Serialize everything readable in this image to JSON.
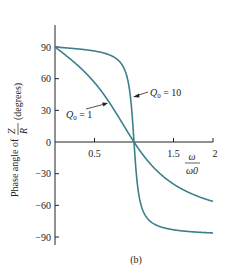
{
  "chart_data": {
    "type": "line",
    "title": "",
    "caption": "(b)",
    "xlabel": "ω/ω0",
    "xlabel_num": "ω",
    "xlabel_den": "ω0",
    "ylabel": "Phase angle of Zp/Rp (degrees)",
    "ylabel_prefix": "Phase angle of",
    "ylabel_num": "Z",
    "ylabel_num_sub": "p",
    "ylabel_den": "R",
    "ylabel_den_sub": "p",
    "ylabel_suffix": "(degrees)",
    "xlim": [
      0,
      2
    ],
    "ylim": [
      -90,
      90
    ],
    "x_ticks": [
      0.5,
      1.5,
      2
    ],
    "x_tick_labels": [
      "0.5",
      "1.5",
      "2"
    ],
    "y_ticks": [
      90,
      60,
      30,
      0,
      -30,
      -60,
      -90
    ],
    "y_tick_labels": [
      "90",
      "60",
      "30",
      "0",
      "−30",
      "−60",
      "−90"
    ],
    "grid": false,
    "series": [
      {
        "name": "Q0 = 1",
        "label": "Q",
        "label_sub": "0",
        "label_value": " = 1",
        "x": [
          0.01,
          0.1,
          0.25,
          0.5,
          0.75,
          1.0,
          1.25,
          1.5,
          1.75,
          2.0
        ],
        "values": [
          89.4,
          84.3,
          75.1,
          56.3,
          30.3,
          0,
          -24.2,
          -39.8,
          -50.5,
          -56.3
        ]
      },
      {
        "name": "Q0 = 10",
        "label": "Q",
        "label_sub": "0",
        "label_value": " = 10",
        "x": [
          0.01,
          0.25,
          0.5,
          0.75,
          0.85,
          0.9,
          0.95,
          1.0,
          1.05,
          1.1,
          1.2,
          1.5,
          2.0
        ],
        "values": [
          90,
          88.5,
          86.2,
          80.3,
          72.0,
          64.6,
          45.7,
          0,
          -44.3,
          -62.4,
          -74.7,
          -83.2,
          -86.2
        ]
      }
    ],
    "line_color": "#3d7f8c"
  }
}
